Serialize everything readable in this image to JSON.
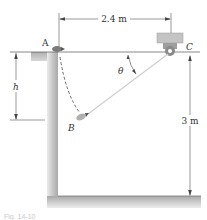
{
  "figure": {
    "labels": {
      "point_a": "A",
      "point_b": "B",
      "point_c": "C",
      "angle": "θ",
      "height_var": "h"
    },
    "dimensions": {
      "horizontal_span": "2.4 m",
      "vertical_drop": "3 m"
    },
    "caption": "Fig. 14-10",
    "colors": {
      "wall_fill": "#bdbdbd",
      "wall_shade": "#e6e6e6",
      "line": "#333333",
      "rope": "#c9c9c9",
      "pulley_block": "#b8b8b8"
    }
  }
}
